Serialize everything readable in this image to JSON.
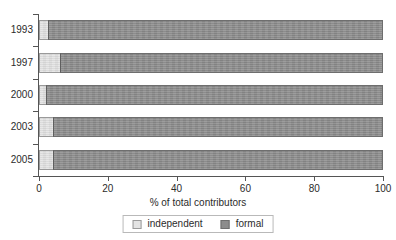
{
  "chart_data": {
    "type": "bar",
    "orientation": "horizontal",
    "stacked": true,
    "title": "",
    "xlabel": "% of total contributors",
    "ylabel": "",
    "categories": [
      "1993",
      "1997",
      "2000",
      "2003",
      "2005"
    ],
    "series": [
      {
        "name": "independent",
        "color": "#e3e3e3",
        "values": [
          2.5,
          6,
          2,
          4,
          4
        ]
      },
      {
        "name": "formal",
        "color": "#8c8c8c",
        "values": [
          97.5,
          94,
          98,
          96,
          96
        ]
      }
    ],
    "xlim": [
      0,
      100
    ],
    "xticks": [
      0,
      20,
      40,
      60,
      80,
      100
    ],
    "xtick_labels": [
      "0",
      "20",
      "40",
      "60",
      "80",
      "100"
    ],
    "grid": false,
    "legend_position": "bottom-center"
  },
  "legend": {
    "items": [
      {
        "label": "independent",
        "swatch": "swatch-light-gray"
      },
      {
        "label": "formal",
        "swatch": "swatch-dark-gray"
      }
    ]
  },
  "colors": {
    "independent": "#e3e3e3",
    "formal": "#8c8c8c",
    "axis": "#555555",
    "text": "#2b2b2b",
    "background": "#ffffff"
  }
}
